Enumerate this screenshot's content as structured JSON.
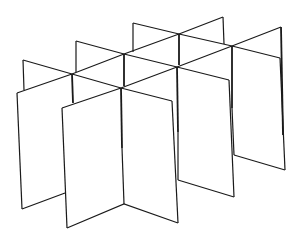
{
  "figure": {
    "style": "black line drawing on white",
    "colors": {
      "background": "#ffffff",
      "stroke": "#1a1a1a"
    },
    "grid": {
      "rows": 2,
      "columns": 3,
      "cells": 6
    }
  }
}
